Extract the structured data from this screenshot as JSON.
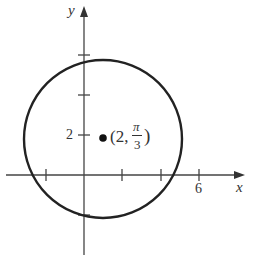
{
  "diagram": {
    "type": "polar-circle-plot",
    "axes": {
      "x_label": "x",
      "y_label": "y",
      "x_tick_label": "6",
      "y_tick_label": "2"
    },
    "point": {
      "label_open": "(2,",
      "label_num": "π",
      "label_den": "3",
      "label_close": ")",
      "description": "(2, π/3)"
    },
    "circle": {
      "color": "#222222"
    }
  }
}
